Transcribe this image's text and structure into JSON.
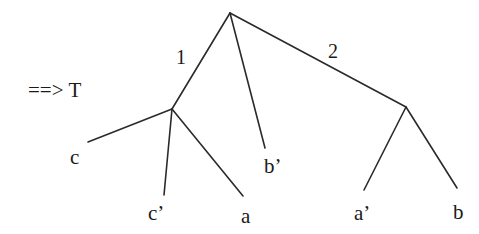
{
  "diagram": {
    "type": "tree",
    "prefix_label": "==> T",
    "edge_labels": {
      "left": "1",
      "right": "2"
    },
    "leaves": {
      "c": "c",
      "c_prime": "c’",
      "a": "a",
      "b_prime": "b’",
      "a_prime": "a’",
      "b": "b"
    },
    "structure": {
      "root": {
        "children": [
          "left_node",
          "b_prime",
          "right_node"
        ]
      },
      "left_node": {
        "edge_label": "1",
        "children": [
          "c",
          "c_prime",
          "a"
        ]
      },
      "right_node": {
        "edge_label": "2",
        "children": [
          "a_prime",
          "b"
        ]
      }
    },
    "colors": {
      "line": "#2a2a2a",
      "text": "#1a1a1a",
      "background": "#ffffff"
    }
  }
}
